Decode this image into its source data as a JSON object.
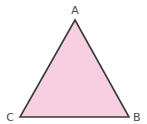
{
  "diagram": {
    "type": "triangle",
    "fill_color": "#f8cfe0",
    "stroke_color": "#3a3a3a",
    "vertices": [
      {
        "label": "A",
        "x": 75,
        "y": 20
      },
      {
        "label": "B",
        "x": 129,
        "y": 117
      },
      {
        "label": "C",
        "x": 20,
        "y": 117
      }
    ]
  }
}
